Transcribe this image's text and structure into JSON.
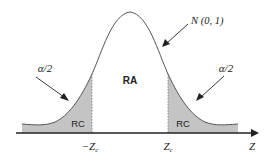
{
  "diagram": {
    "type": "standard normal distribution with two-tailed critical regions",
    "curve_label": "N (0, 1)",
    "center_region_label": "RA",
    "tail_region_labels": [
      "RC",
      "RC"
    ],
    "tail_probability_labels": [
      "α/2",
      "α/2"
    ],
    "axis_label": "Z",
    "critical_value_labels": {
      "left": "−Z",
      "left_sub": "c",
      "right": "Z",
      "right_sub": "c"
    },
    "colors": {
      "curve": "#555555",
      "tail_fill": "#c4c4c4",
      "axis": "#222222",
      "text": "#222222"
    }
  }
}
